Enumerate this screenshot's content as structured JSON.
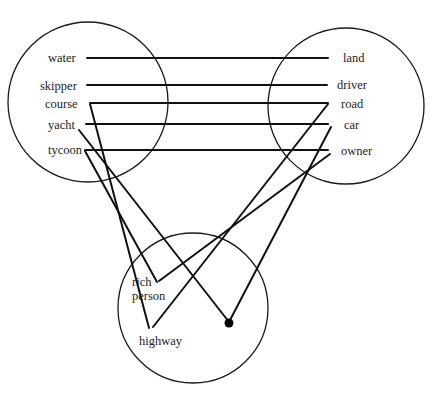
{
  "diagram": {
    "type": "conceptual-blend",
    "colors": {
      "stroke": "#111111",
      "text": "#222222",
      "background": "#ffffff"
    },
    "spaces": [
      {
        "id": "input1",
        "name": "input-space-sea",
        "cx": 88,
        "cy": 102,
        "r": 80
      },
      {
        "id": "input2",
        "name": "input-space-land",
        "cx": 346,
        "cy": 106,
        "r": 78
      },
      {
        "id": "blend",
        "name": "blended-space",
        "cx": 193,
        "cy": 308,
        "r": 75
      }
    ],
    "labels": {
      "water": "water",
      "skipper": "skipper",
      "course": "course",
      "yacht": "yacht",
      "tycoon": "tycoon",
      "land": "land",
      "driver": "driver",
      "road": "road",
      "car": "car",
      "owner": "owner",
      "rich": "rich",
      "person": "person",
      "highway": "highway"
    },
    "mappings": [
      {
        "from": "water",
        "to": "land"
      },
      {
        "from": "skipper",
        "to": "driver"
      },
      {
        "from": "course",
        "to": "road"
      },
      {
        "from": "yacht",
        "to": "car"
      },
      {
        "from": "tycoon",
        "to": "owner"
      },
      {
        "from": "course",
        "to": "highway"
      },
      {
        "from": "road",
        "to": "highway"
      },
      {
        "from": "yacht",
        "to": "blend-dot"
      },
      {
        "from": "car",
        "to": "blend-dot"
      },
      {
        "from": "tycoon",
        "to": "rich person"
      },
      {
        "from": "owner",
        "to": "rich person"
      }
    ]
  }
}
